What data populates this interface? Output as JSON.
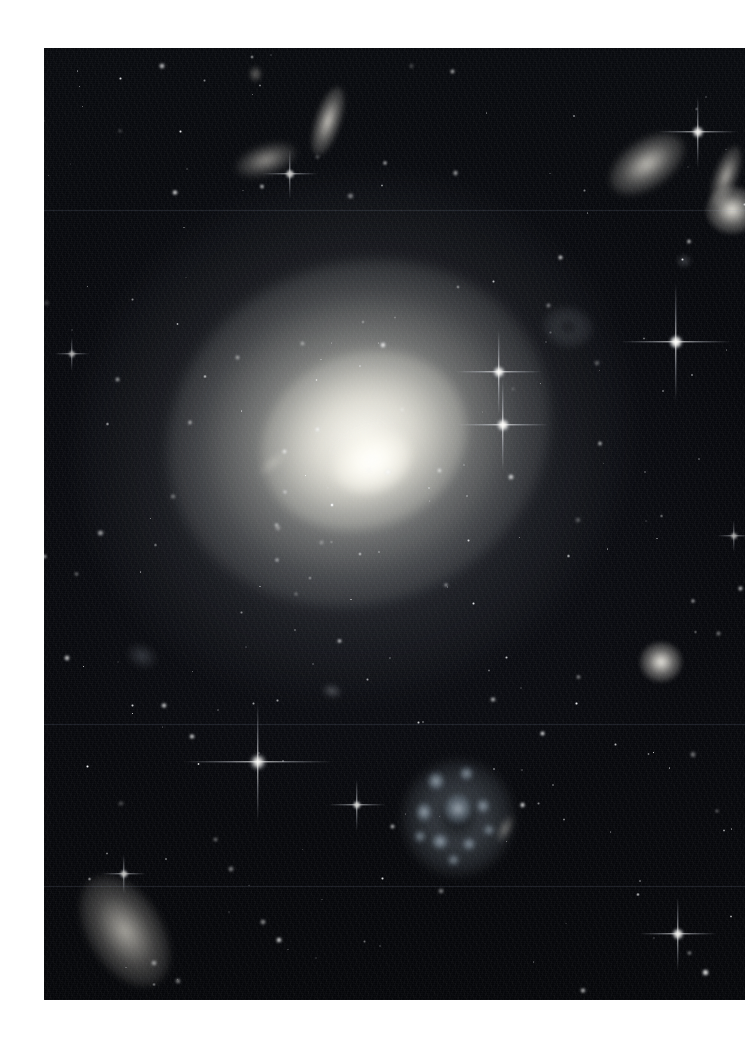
{
  "page": {
    "background_color": "#ffffff",
    "width": 753,
    "height": 1044
  },
  "photo": {
    "name": "deep-field-astronomy-photograph",
    "frame": {
      "x": 44,
      "y": 48,
      "width": 701,
      "height": 952
    },
    "sky_color": "#06070b",
    "description": "Deep-sky astronomical photograph: a large diffuse elliptical galaxy dominates the centre, surrounded by many smaller background galaxies and foreground stars showing four-point diffraction spikes.",
    "scanlines": [
      {
        "name": "detector-seam-upper",
        "y": 162
      },
      {
        "name": "detector-seam-mid",
        "y": 676
      },
      {
        "name": "detector-seam-lower",
        "y": 838
      }
    ]
  },
  "objects": {
    "primary_galaxy": {
      "name": "central-elliptical-galaxy",
      "type": "elliptical",
      "center_x": 328,
      "center_y": 413,
      "major_axis": 560,
      "minor_axis": 520,
      "position_angle_deg": -22,
      "core_color": "#fffffd",
      "halo_color": "#cdcdc6"
    },
    "galaxies": [
      {
        "name": "galaxy-edge-on-top-center",
        "type": "edge-on-spiral",
        "x": 271,
        "y": 37,
        "w": 26,
        "h": 72,
        "rot": 18,
        "brightness": 0.82,
        "color": "#f0ece2"
      },
      {
        "name": "galaxy-lenticular-top-left",
        "type": "lenticular",
        "x": 191,
        "y": 97,
        "w": 62,
        "h": 30,
        "rot": -18,
        "brightness": 0.62,
        "color": "#e8e4da"
      },
      {
        "name": "galaxy-small-top-left-dot",
        "type": "compact",
        "x": 205,
        "y": 18,
        "w": 13,
        "h": 16,
        "rot": 0,
        "brightness": 0.5,
        "color": "#ded9cf"
      },
      {
        "name": "galaxy-lenticular-top-right",
        "type": "lenticular",
        "x": 561,
        "y": 92,
        "w": 84,
        "h": 48,
        "rot": -34,
        "brightness": 0.8,
        "color": "#efece2"
      },
      {
        "name": "galaxy-edge-on-right",
        "type": "edge-on-spiral",
        "x": 670,
        "y": 96,
        "w": 24,
        "h": 64,
        "rot": 20,
        "brightness": 0.72,
        "color": "#e9e5db"
      },
      {
        "name": "galaxy-elliptical-right",
        "type": "elliptical",
        "x": 662,
        "y": 138,
        "w": 52,
        "h": 48,
        "rot": 0,
        "brightness": 0.92,
        "color": "#fbf8ee"
      },
      {
        "name": "galaxy-faint-ring",
        "type": "ring",
        "x": 498,
        "y": 258,
        "w": 52,
        "h": 42,
        "rot": 12,
        "brightness": 0.3,
        "color": "#b9c2cc"
      },
      {
        "name": "galaxy-edge-on-in-halo",
        "type": "edge-on-spiral",
        "x": 212,
        "y": 408,
        "w": 34,
        "h": 14,
        "rot": -40,
        "brightness": 0.34,
        "color": "#e2e0d6"
      },
      {
        "name": "galaxy-compact-right-mid",
        "type": "elliptical",
        "x": 596,
        "y": 594,
        "w": 42,
        "h": 40,
        "rot": 0,
        "brightness": 0.95,
        "color": "#fdfaf1"
      },
      {
        "name": "galaxy-faint-left-mid",
        "type": "irregular",
        "x": 82,
        "y": 596,
        "w": 32,
        "h": 24,
        "rot": 25,
        "brightness": 0.26,
        "color": "#a9b4c0"
      },
      {
        "name": "galaxy-irregular-blue",
        "type": "irregular-starburst",
        "x": 358,
        "y": 712,
        "w": 112,
        "h": 116,
        "rot": 8,
        "brightness": 0.52,
        "color": "#b9cbd8"
      },
      {
        "name": "galaxy-spiral-bottom-left",
        "type": "tilted-spiral",
        "x": 44,
        "y": 822,
        "w": 74,
        "h": 122,
        "rot": -32,
        "brightness": 0.7,
        "color": "#ece8dd"
      },
      {
        "name": "galaxy-small-bottom-center",
        "type": "compact",
        "x": 278,
        "y": 636,
        "w": 20,
        "h": 14,
        "rot": 15,
        "brightness": 0.34,
        "color": "#cfd4da"
      },
      {
        "name": "galaxy-edge-on-lower-right",
        "type": "edge-on-spiral",
        "x": 454,
        "y": 766,
        "w": 14,
        "h": 30,
        "rot": 26,
        "brightness": 0.44,
        "color": "#dcd9cf"
      },
      {
        "name": "galaxy-faint-upper-right",
        "type": "compact",
        "x": 632,
        "y": 206,
        "w": 16,
        "h": 14,
        "rot": 0,
        "brightness": 0.3,
        "color": "#c2c9d2"
      }
    ],
    "diffraction_stars": [
      {
        "name": "star-bright-halo-upper",
        "x": 455,
        "y": 324,
        "core": 11,
        "spike_h": 86,
        "spike_v": 86,
        "intensity": 1.0
      },
      {
        "name": "star-bright-halo-lower",
        "x": 459,
        "y": 377,
        "core": 12,
        "spike_h": 92,
        "spike_v": 92,
        "intensity": 1.0
      },
      {
        "name": "star-bright-right-upper",
        "x": 632,
        "y": 294,
        "core": 13,
        "spike_h": 112,
        "spike_v": 120,
        "intensity": 1.0
      },
      {
        "name": "star-bright-lower-left",
        "x": 214,
        "y": 714,
        "core": 14,
        "spike_h": 150,
        "spike_v": 120,
        "intensity": 1.0
      },
      {
        "name": "star-mid-lower-center",
        "x": 313,
        "y": 757,
        "core": 8,
        "spike_h": 58,
        "spike_v": 52,
        "intensity": 0.85
      },
      {
        "name": "star-bottom-right",
        "x": 634,
        "y": 886,
        "core": 11,
        "spike_h": 78,
        "spike_v": 74,
        "intensity": 0.95
      },
      {
        "name": "star-top-right-corner",
        "x": 654,
        "y": 84,
        "core": 11,
        "spike_h": 80,
        "spike_v": 72,
        "intensity": 0.95
      },
      {
        "name": "star-top-center-left",
        "x": 246,
        "y": 126,
        "core": 9,
        "spike_h": 56,
        "spike_v": 50,
        "intensity": 0.8
      },
      {
        "name": "star-bottom-left-small",
        "x": 80,
        "y": 826,
        "core": 8,
        "spike_h": 44,
        "spike_v": 40,
        "intensity": 0.78
      },
      {
        "name": "star-left-mid",
        "x": 28,
        "y": 306,
        "core": 7,
        "spike_h": 36,
        "spike_v": 34,
        "intensity": 0.7
      },
      {
        "name": "star-right-edge-mid",
        "x": 690,
        "y": 488,
        "core": 7,
        "spike_h": 34,
        "spike_v": 32,
        "intensity": 0.68
      }
    ],
    "field_star_count": 210
  },
  "credits": {
    "visible_text": ""
  }
}
